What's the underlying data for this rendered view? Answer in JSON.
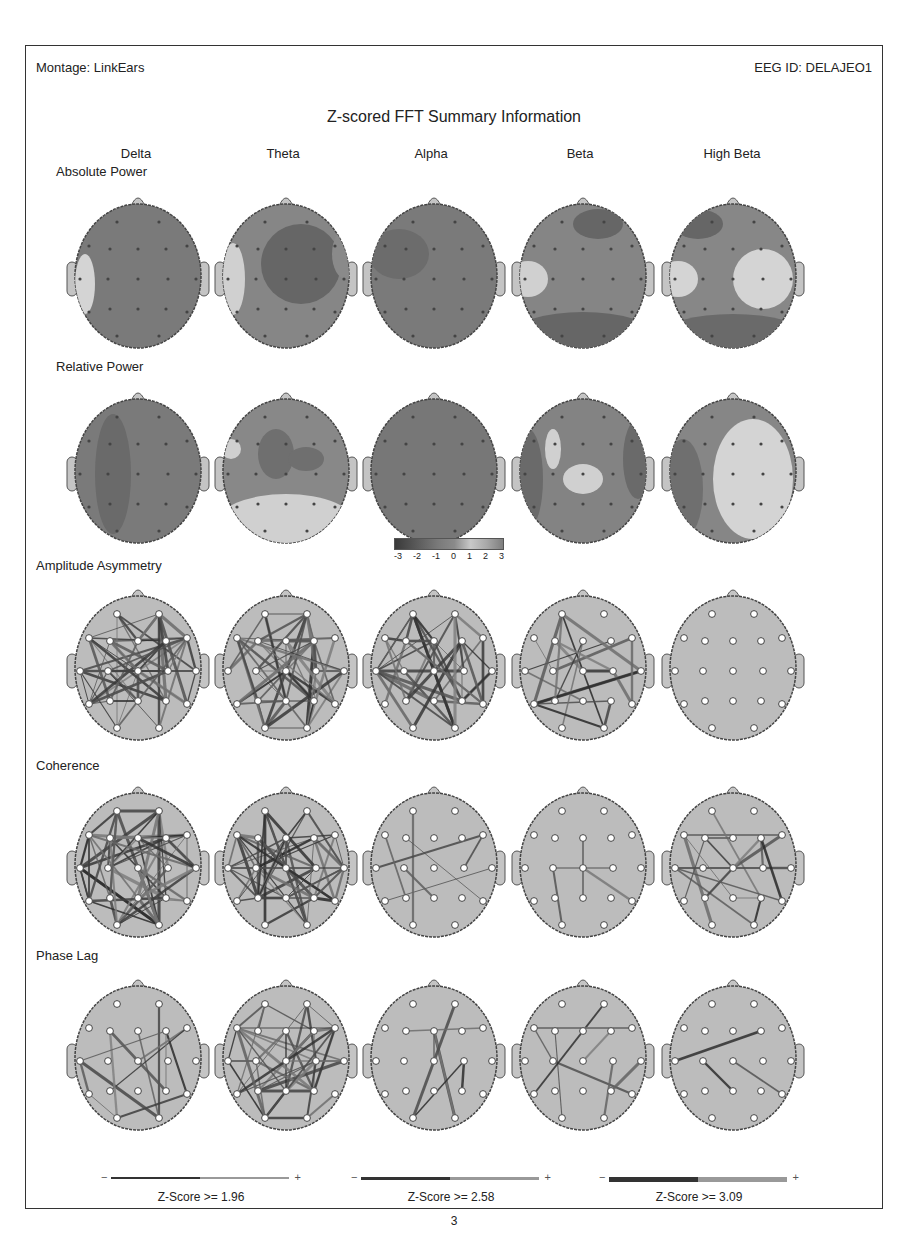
{
  "header": {
    "montage": "Montage: LinkEars",
    "eeg_id": "EEG ID: DELAJEO1",
    "title": "Z-scored FFT Summary Information"
  },
  "bands": [
    "Delta",
    "Theta",
    "Alpha",
    "Beta",
    "High Beta"
  ],
  "rows": [
    {
      "label": "Absolute Power",
      "type": "topomap"
    },
    {
      "label": "Relative Power",
      "type": "topomap"
    },
    {
      "label": "Amplitude Asymmetry",
      "type": "connectivity"
    },
    {
      "label": "Coherence",
      "type": "connectivity"
    },
    {
      "label": "Phase Lag",
      "type": "connectivity"
    }
  ],
  "colorbar": {
    "ticks": [
      "-3",
      "-2",
      "-1",
      "0",
      "1",
      "2",
      "3"
    ]
  },
  "legend": [
    {
      "minus": "−",
      "plus": "+",
      "label": "Z-Score >= 1.96",
      "thickness": 1.5
    },
    {
      "minus": "−",
      "plus": "+",
      "label": "Z-Score >= 2.58",
      "thickness": 3
    },
    {
      "minus": "−",
      "plus": "+",
      "label": "Z-Score >= 3.09",
      "thickness": 4.5
    }
  ],
  "page_number": "3",
  "colors": {
    "head_fill": "#b8b8b8",
    "dark": "#333333",
    "mid": "#6e6e6e",
    "low": "#7a7a7a",
    "high": "#d0d0d0"
  }
}
